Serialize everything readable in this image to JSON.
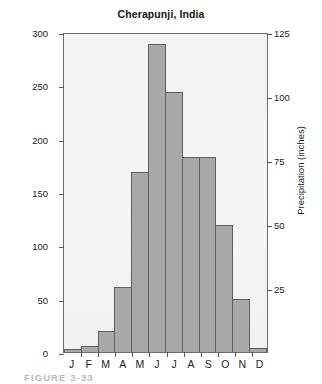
{
  "chart_data": {
    "type": "bar",
    "title": "Cherapunji, India",
    "xlabel": "",
    "ylabel": "Precipitation (cm)",
    "ylabel_secondary": "Precipitation (inches)",
    "categories": [
      "J",
      "F",
      "M",
      "A",
      "M",
      "J",
      "J",
      "A",
      "S",
      "O",
      "N",
      "D"
    ],
    "values": [
      3,
      6,
      20,
      61,
      170,
      291,
      245,
      184,
      184,
      120,
      50,
      4
    ],
    "ylim": [
      0,
      300
    ],
    "yticks": [
      0,
      50,
      100,
      150,
      200,
      250,
      300
    ],
    "ylim_secondary": [
      0,
      125
    ],
    "yticks_secondary": [
      25,
      50,
      75,
      100,
      125
    ],
    "grid": false,
    "legend": false,
    "bar_color": "#a8a8a8",
    "bar_edge_color": "#5f5f5f",
    "plot_bg_color": "#f4f4f4"
  },
  "caption": {
    "text": "FIGURE 3-33"
  }
}
